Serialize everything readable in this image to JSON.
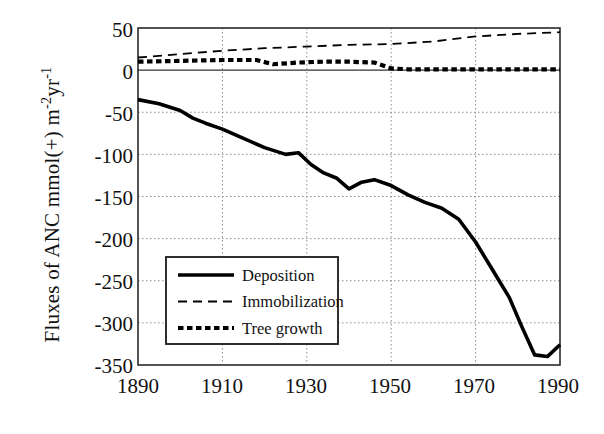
{
  "chart_data": {
    "type": "line",
    "title": "",
    "xlabel": "",
    "ylabel": "Fluxes of ANC  mmol(+) m-2yr-1",
    "ylabel_parts": {
      "lead": "Fluxes of ANC  mmol(+) m",
      "sup1": "-2",
      "mid": "yr",
      "sup2": "-1"
    },
    "xlim": [
      1890,
      1990
    ],
    "ylim": [
      -350,
      50
    ],
    "ytick_values": [
      50,
      0,
      -50,
      -100,
      -150,
      -200,
      -250,
      -300,
      -350
    ],
    "ytick_labels": [
      "50",
      "0",
      "-50",
      "-100",
      "-150",
      "-200",
      "-250",
      "-300",
      "-350"
    ],
    "xtick_values": [
      1890,
      1910,
      1930,
      1950,
      1970,
      1990
    ],
    "xtick_labels": [
      "1890",
      "1910",
      "1930",
      "1950",
      "1970",
      "1990"
    ],
    "grid": "dotted horizontal and vertical gridlines at ticks; solid zero line",
    "legend_position": "lower-left inside axes",
    "series": [
      {
        "name": "Deposition",
        "style": "solid",
        "width": 3.6,
        "color": "#000000",
        "x": [
          1890,
          1895,
          1900,
          1903,
          1906,
          1910,
          1915,
          1920,
          1925,
          1928,
          1931,
          1934,
          1937,
          1940,
          1943,
          1946,
          1950,
          1954,
          1958,
          1962,
          1966,
          1970,
          1974,
          1978,
          1981,
          1984,
          1987,
          1990
        ],
        "values": [
          -35,
          -40,
          -48,
          -57,
          -63,
          -70,
          -81,
          -92,
          -100,
          -98,
          -112,
          -122,
          -128,
          -141,
          -133,
          -130,
          -137,
          -148,
          -157,
          -164,
          -177,
          -204,
          -237,
          -270,
          -305,
          -338,
          -340,
          -326
        ]
      },
      {
        "name": "Immobilization",
        "style": "dashed",
        "width": 1.8,
        "color": "#000000",
        "x": [
          1890,
          1900,
          1910,
          1920,
          1930,
          1940,
          1950,
          1960,
          1970,
          1980,
          1990
        ],
        "values": [
          15,
          19,
          23,
          26,
          28,
          30,
          31,
          34,
          40,
          43,
          45
        ]
      },
      {
        "name": "Tree growth",
        "style": "dotted",
        "width": 4.2,
        "color": "#000000",
        "x": [
          1890,
          1900,
          1910,
          1918,
          1922,
          1928,
          1934,
          1940,
          1946,
          1950,
          1954,
          1960,
          1970,
          1980,
          1990
        ],
        "values": [
          10,
          11,
          12,
          12,
          7,
          9,
          10,
          10,
          9,
          2,
          1,
          1,
          1,
          1,
          1
        ]
      }
    ]
  },
  "legend": {
    "items": [
      {
        "label": "Deposition",
        "style": "solid"
      },
      {
        "label": "Immobilization",
        "style": "dashed"
      },
      {
        "label": "Tree growth",
        "style": "dotted"
      }
    ]
  },
  "colors": {
    "axis": "#1a1a1a",
    "grid": "#8a8a8a",
    "line": "#000000",
    "background": "#ffffff"
  }
}
